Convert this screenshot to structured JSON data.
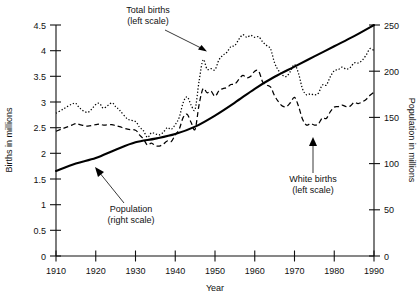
{
  "chart_data": {
    "type": "line",
    "title": "",
    "xlabel": "Year",
    "ylabel": "Births in millions",
    "y2label": "Population in millions",
    "xlim": [
      1910,
      1990
    ],
    "ylim": [
      0,
      4.5
    ],
    "y2lim": [
      0,
      250
    ],
    "grid": false,
    "legend_position": "inline-annotations",
    "xticks": [
      1910,
      1920,
      1930,
      1940,
      1950,
      1960,
      1970,
      1980,
      1990
    ],
    "xtick_labels": [
      "1910",
      "1920",
      "1930",
      "1940",
      "1950",
      "1960",
      "1970",
      "1980",
      "1990"
    ],
    "yticks": [
      0,
      0.5,
      1,
      1.5,
      2,
      2.5,
      3,
      3.5,
      4,
      4.5
    ],
    "ytick_labels": [
      "0",
      "0.5",
      "1",
      "1.5",
      "2",
      "2.5",
      "3",
      "3.5",
      "4",
      "4.5"
    ],
    "y2ticks": [
      0,
      50,
      100,
      150,
      200,
      250
    ],
    "y2tick_labels": [
      "0",
      "50",
      "100",
      "150",
      "200",
      "250"
    ],
    "annotations": [
      {
        "id": "total-births",
        "text_line1": "Total births",
        "text_line2": "(left scale)",
        "points_to_series": "Total births"
      },
      {
        "id": "white-births",
        "text_line1": "White births",
        "text_line2": "(left scale)",
        "points_to_series": "White births"
      },
      {
        "id": "population",
        "text_line1": "Population",
        "text_line2": "(right scale)",
        "points_to_series": "Population"
      }
    ],
    "series": [
      {
        "name": "Total births",
        "axis": "left",
        "units": "millions",
        "style": "dotted",
        "x": [
          1910,
          1912,
          1914,
          1915,
          1916,
          1918,
          1920,
          1921,
          1922,
          1924,
          1925,
          1926,
          1928,
          1930,
          1931,
          1932,
          1933,
          1934,
          1935,
          1936,
          1937,
          1938,
          1939,
          1940,
          1941,
          1942,
          1943,
          1944,
          1945,
          1946,
          1947,
          1948,
          1949,
          1950,
          1951,
          1952,
          1953,
          1954,
          1955,
          1956,
          1957,
          1958,
          1959,
          1960,
          1961,
          1962,
          1963,
          1964,
          1965,
          1966,
          1967,
          1968,
          1969,
          1970,
          1971,
          1972,
          1973,
          1974,
          1975,
          1976,
          1977,
          1978,
          1979,
          1980,
          1981,
          1982,
          1983,
          1984,
          1985,
          1986,
          1987,
          1988,
          1989,
          1990
        ],
        "y": [
          2.78,
          2.87,
          2.96,
          2.97,
          2.88,
          2.8,
          2.95,
          2.97,
          2.88,
          2.98,
          2.91,
          2.84,
          2.67,
          2.62,
          2.51,
          2.44,
          2.31,
          2.4,
          2.38,
          2.36,
          2.41,
          2.5,
          2.47,
          2.56,
          2.7,
          2.99,
          3.1,
          2.94,
          2.86,
          3.41,
          3.82,
          3.64,
          3.65,
          3.63,
          3.82,
          3.91,
          3.97,
          4.08,
          4.1,
          4.22,
          4.31,
          4.26,
          4.3,
          4.26,
          4.27,
          4.17,
          4.1,
          4.03,
          3.76,
          3.61,
          3.52,
          3.5,
          3.6,
          3.73,
          3.56,
          3.26,
          3.14,
          3.16,
          3.14,
          3.17,
          3.33,
          3.33,
          3.49,
          3.61,
          3.63,
          3.68,
          3.64,
          3.67,
          3.76,
          3.76,
          3.81,
          3.91,
          4.04,
          4.0
        ],
        "min": 2.31,
        "max": 4.31,
        "min_year": 1933,
        "max_year": 1957,
        "start_value": 2.78,
        "end_value": 4.0
      },
      {
        "name": "White births",
        "axis": "left",
        "units": "millions",
        "style": "dashed",
        "x": [
          1910,
          1912,
          1914,
          1915,
          1916,
          1918,
          1920,
          1921,
          1922,
          1924,
          1925,
          1926,
          1928,
          1930,
          1931,
          1932,
          1933,
          1934,
          1935,
          1936,
          1937,
          1938,
          1939,
          1940,
          1941,
          1942,
          1943,
          1944,
          1945,
          1946,
          1947,
          1948,
          1949,
          1950,
          1951,
          1952,
          1953,
          1954,
          1955,
          1956,
          1957,
          1958,
          1959,
          1960,
          1961,
          1962,
          1963,
          1964,
          1965,
          1966,
          1967,
          1968,
          1969,
          1970,
          1971,
          1972,
          1973,
          1974,
          1975,
          1976,
          1977,
          1978,
          1979,
          1980,
          1981,
          1982,
          1983,
          1984,
          1985,
          1986,
          1987,
          1988,
          1989,
          1990
        ],
        "y": [
          2.43,
          2.49,
          2.55,
          2.58,
          2.56,
          2.53,
          2.56,
          2.57,
          2.55,
          2.56,
          2.54,
          2.52,
          2.47,
          2.45,
          2.36,
          2.28,
          2.16,
          2.2,
          2.15,
          2.14,
          2.18,
          2.24,
          2.23,
          2.36,
          2.47,
          2.7,
          2.76,
          2.6,
          2.47,
          2.95,
          3.26,
          3.18,
          3.21,
          3.11,
          3.22,
          3.26,
          3.28,
          3.34,
          3.35,
          3.44,
          3.52,
          3.47,
          3.5,
          3.6,
          3.6,
          3.39,
          3.33,
          3.29,
          3.12,
          3.0,
          2.92,
          2.91,
          2.99,
          3.09,
          2.92,
          2.67,
          2.55,
          2.58,
          2.55,
          2.57,
          2.69,
          2.68,
          2.81,
          2.9,
          2.91,
          2.94,
          2.91,
          2.92,
          2.99,
          2.97,
          3.0,
          3.05,
          3.13,
          3.19
        ],
        "min": 2.14,
        "max": 3.6,
        "min_year": 1936,
        "max_year": 1960,
        "start_value": 2.43,
        "end_value": 3.19
      },
      {
        "name": "Population",
        "axis": "right",
        "units": "millions",
        "style": "solid",
        "x": [
          1910,
          1915,
          1920,
          1925,
          1930,
          1935,
          1940,
          1945,
          1950,
          1955,
          1960,
          1965,
          1970,
          1975,
          1980,
          1985,
          1990
        ],
        "y": [
          92,
          100,
          106,
          115,
          123,
          127,
          132,
          140,
          152,
          166,
          181,
          194,
          205,
          216,
          227,
          238,
          250
        ],
        "min": 92,
        "max": 250,
        "min_year": 1910,
        "max_year": 1990,
        "start_value": 92,
        "end_value": 250
      }
    ]
  },
  "figure": {
    "background_color": "#ffffff",
    "line_color": "#000000",
    "text_color": "#111111"
  }
}
